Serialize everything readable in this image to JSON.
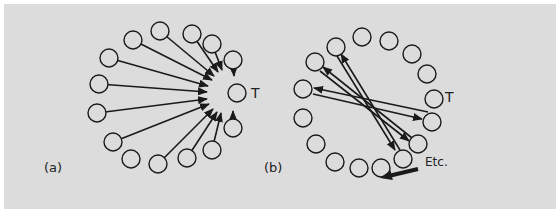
{
  "figure": {
    "background": "#dcdcdc",
    "stroke_color": "#1a1a1a",
    "node_radius": 9,
    "panel_a": {
      "label": "(a)",
      "label_pos": [
        44,
        172
      ],
      "target": {
        "label": "T",
        "center": [
          237,
          93
        ],
        "label_pos": [
          251,
          98
        ]
      },
      "nodes": [
        [
          160,
          31
        ],
        [
          133,
          40
        ],
        [
          192,
          34
        ],
        [
          212,
          44
        ],
        [
          109,
          58
        ],
        [
          233,
          60
        ],
        [
          99,
          84
        ],
        [
          237,
          93
        ],
        [
          97,
          113
        ],
        [
          233,
          128
        ],
        [
          113,
          142
        ],
        [
          212,
          150
        ],
        [
          131,
          159
        ],
        [
          187,
          158
        ],
        [
          158,
          164
        ]
      ],
      "arrows": [
        {
          "from": [
            133,
            40
          ],
          "to": [
            212,
            80
          ]
        },
        {
          "from": [
            160,
            31
          ],
          "to": [
            214,
            76
          ]
        },
        {
          "from": [
            192,
            34
          ],
          "to": [
            218,
            72
          ]
        },
        {
          "from": [
            212,
            44
          ],
          "to": [
            222,
            70
          ]
        },
        {
          "from": [
            109,
            58
          ],
          "to": [
            208,
            86
          ]
        },
        {
          "from": [
            233,
            60
          ],
          "to": [
            234,
            76
          ]
        },
        {
          "from": [
            99,
            84
          ],
          "to": [
            207,
            92
          ]
        },
        {
          "from": [
            97,
            113
          ],
          "to": [
            207,
            99
          ]
        },
        {
          "from": [
            113,
            142
          ],
          "to": [
            209,
            104
          ]
        },
        {
          "from": [
            158,
            164
          ],
          "to": [
            213,
            109
          ]
        },
        {
          "from": [
            187,
            158
          ],
          "to": [
            217,
            112
          ]
        },
        {
          "from": [
            212,
            150
          ],
          "to": [
            221,
            113
          ]
        },
        {
          "from": [
            233,
            128
          ],
          "to": [
            233,
            111
          ]
        }
      ]
    },
    "panel_b": {
      "label": "(b)",
      "label_pos": [
        264,
        172
      ],
      "target": {
        "label": "T",
        "center": [
          434,
          99
        ],
        "label_pos": [
          445,
          102
        ]
      },
      "etc_label": "Etc.",
      "etc_pos": [
        425,
        166
      ],
      "nodes": [
        [
          362,
          37
        ],
        [
          389,
          41
        ],
        [
          336,
          47
        ],
        [
          412,
          54
        ],
        [
          315,
          62
        ],
        [
          427,
          74
        ],
        [
          303,
          89
        ],
        [
          434,
          99
        ],
        [
          303,
          118
        ],
        [
          432,
          122
        ],
        [
          316,
          144
        ],
        [
          418,
          144
        ],
        [
          403,
          159
        ],
        [
          335,
          162
        ],
        [
          359,
          168
        ],
        [
          381,
          168
        ]
      ],
      "arrows": [
        {
          "from": [
            428,
            112
          ],
          "to": [
            314,
            88
          ]
        },
        {
          "from": [
            313,
            94
          ],
          "to": [
            422,
            119
          ]
        },
        {
          "from": [
            412,
            138
          ],
          "to": [
            323,
            67
          ]
        },
        {
          "from": [
            320,
            71
          ],
          "to": [
            409,
            141
          ]
        },
        {
          "from": [
            400,
            150
          ],
          "to": [
            341,
            54
          ]
        },
        {
          "from": [
            337,
            56
          ],
          "to": [
            395,
            150
          ]
        }
      ],
      "big_arrow": {
        "from": [
          418,
          169
        ],
        "to": [
          380,
          178
        ]
      }
    }
  }
}
